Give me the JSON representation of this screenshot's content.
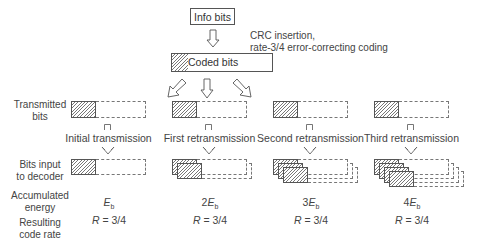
{
  "top": {
    "info_bits": "Info bits",
    "coded_bits": "Coded bits",
    "coding_note_line1": "CRC insertion,",
    "coding_note_line2": "rate-3/4 error-correcting coding"
  },
  "row_labels": {
    "transmitted_line1": "Transmitted",
    "transmitted_line2": "bits",
    "decoder_line1": "Bits input",
    "decoder_line2": "to decoder",
    "energy_line1": "Accumulated",
    "energy_line2": "energy",
    "rate_line1": "Resulting",
    "rate_line2": "code rate"
  },
  "columns": [
    {
      "name": "Initial transmission",
      "energy_prefix": "",
      "energy_symbol": "E",
      "energy_sub": "b",
      "rate_symbol": "R",
      "rate_value": " = 3/4",
      "stack": 1
    },
    {
      "name": "First retransmission",
      "energy_prefix": "2",
      "energy_symbol": "E",
      "energy_sub": "b",
      "rate_symbol": "R",
      "rate_value": " = 3/4",
      "stack": 2
    },
    {
      "name": "Second retransmission",
      "energy_prefix": "3",
      "energy_symbol": "E",
      "energy_sub": "b",
      "rate_symbol": "R",
      "rate_value": " = 3/4",
      "stack": 3
    },
    {
      "name": "Third retransmission",
      "energy_prefix": "4",
      "energy_symbol": "E",
      "energy_sub": "b",
      "rate_symbol": "R",
      "rate_value": " = 3/4",
      "stack": 4
    }
  ]
}
